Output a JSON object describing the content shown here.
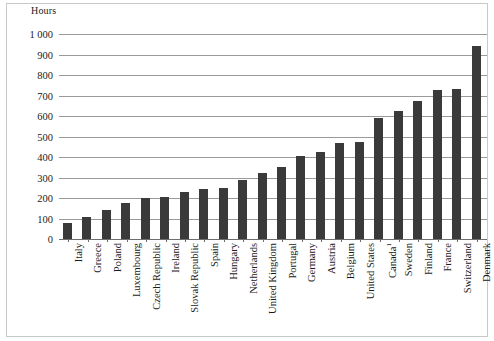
{
  "chart_data": {
    "type": "bar",
    "title": "",
    "subtitle": "",
    "xlabel": "",
    "ylabel": "Hours",
    "ylim": [
      0,
      1000
    ],
    "ytick_step": 100,
    "ytick_labels": [
      "1 000",
      "900",
      "800",
      "700",
      "600",
      "500",
      "400",
      "300",
      "200",
      "100",
      "0"
    ],
    "grid": true,
    "legend": false,
    "bar_color": "#3a3a3a",
    "gridline_color": "#9a9a9a",
    "categories": [
      "Italy",
      "Greece",
      "Poland",
      "Luxembourg",
      "Czech Republic",
      "Ireland",
      "Slovak Republic",
      "Spain",
      "Hungary",
      "Netherlands",
      "United Kingdom",
      "Portugal",
      "Germany",
      "Austria",
      "Belgium",
      "United States",
      "Canada",
      "Sweden",
      "Finland",
      "France",
      "Switzerland",
      "Denmark"
    ],
    "category_footnotes": {
      "Canada": "1"
    },
    "values": [
      80,
      105,
      140,
      175,
      200,
      205,
      230,
      245,
      250,
      290,
      320,
      350,
      405,
      425,
      470,
      475,
      590,
      625,
      675,
      725,
      730,
      940
    ]
  }
}
